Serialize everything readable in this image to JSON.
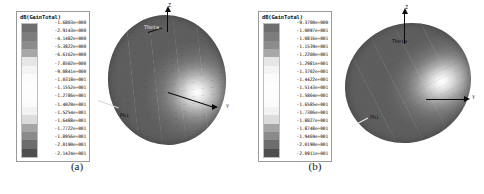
{
  "figure": {
    "panels": [
      {
        "id": "a",
        "caption": "(a)",
        "legend": {
          "title": "dB(GainTotal)",
          "values": [
            "-1.6803e+000",
            "-2.9143e+000",
            "-4.1482e+000",
            "-5.3822e+000",
            "-6.6162e+000",
            "-7.8502e+000",
            "-9.0841e+000",
            "-1.0318e+001",
            "-1.1552e+001",
            "-1.2786e+001",
            "-1.4020e+001",
            "-1.5254e+001",
            "-1.6488e+001",
            "-1.7722e+001",
            "-1.8956e+001",
            "-2.0190e+001",
            "-2.1424e+001"
          ],
          "swatch_colors": [
            "#6e6e6e",
            "#7d7d7d",
            "#8c8c8c",
            "#a8a8a8",
            "#e6e6e6",
            "#f4f4f4",
            "#fbfbfb",
            "#fdfdfd",
            "#fdfdfd",
            "#fbfbfb",
            "#f2f2f2",
            "#dcdcdc",
            "#a5a5a5",
            "#8a8a8a",
            "#6d6d6d",
            "#4e4e4e"
          ]
        },
        "axes": [
          {
            "name": "z-axis",
            "label": "Z"
          },
          {
            "name": "y-axis",
            "label": "Y"
          },
          {
            "name": "theta-axis",
            "label": "Theta"
          },
          {
            "name": "phi-axis",
            "label": "Phi"
          }
        ]
      },
      {
        "id": "b",
        "caption": "(b)",
        "legend": {
          "title": "dB(GainTotal)",
          "values": [
            "-9.3700e+000",
            "-1.0097e+001",
            "-1.0816e+001",
            "-1.1539e+001",
            "-1.2260e+001",
            "-1.2981e+001",
            "-1.3702e+001",
            "-1.4422e+001",
            "-1.5143e+001",
            "-1.5864e+001",
            "-1.6585e+001",
            "-1.7306e+001",
            "-1.8027e+001",
            "-1.8748e+001",
            "-1.9469e+001",
            "-2.0190e+001",
            "-2.0911e+001"
          ],
          "swatch_colors": [
            "#6e6e6e",
            "#7d7d7d",
            "#8c8c8c",
            "#a8a8a8",
            "#e6e6e6",
            "#f4f4f4",
            "#fbfbfb",
            "#fdfdfd",
            "#fdfdfd",
            "#fbfbfb",
            "#f2f2f2",
            "#dcdcdc",
            "#a5a5a5",
            "#8a8a8a",
            "#6d6d6d",
            "#4e4e4e"
          ]
        },
        "axes": [
          {
            "name": "z-axis",
            "label": "Z"
          },
          {
            "name": "y-axis",
            "label": "Y"
          },
          {
            "name": "theta-axis",
            "label": "Theta"
          },
          {
            "name": "phi-axis",
            "label": "Phi"
          }
        ]
      }
    ]
  },
  "chart_data": [
    {
      "type": "heatmap",
      "title": "dB(GainTotal)",
      "panel": "(a)",
      "plot_style": "3d-far-field-radiation-pattern",
      "colorbar_label": "dB(GainTotal)",
      "colorbar_ticks": [
        -1.6803,
        -2.9143,
        -4.1482,
        -5.3822,
        -6.6162,
        -7.8502,
        -9.0841,
        -10.318,
        -11.552,
        -12.786,
        -14.02,
        -15.254,
        -16.488,
        -17.722,
        -18.956,
        -20.19,
        -21.424
      ],
      "zlim": [
        -21.424,
        -1.6803
      ],
      "units": "dB",
      "colormap": "grayscale",
      "legend_position": "left",
      "grid": true,
      "annotations": [
        "Z",
        "Y",
        "Theta",
        "Phi"
      ]
    },
    {
      "type": "heatmap",
      "title": "dB(GainTotal)",
      "panel": "(b)",
      "plot_style": "3d-far-field-radiation-pattern",
      "colorbar_label": "dB(GainTotal)",
      "colorbar_ticks": [
        -9.37,
        -10.097,
        -10.816,
        -11.539,
        -12.26,
        -12.981,
        -13.702,
        -14.422,
        -15.143,
        -15.864,
        -16.585,
        -17.306,
        -18.027,
        -18.748,
        -19.469,
        -20.19,
        -20.911
      ],
      "zlim": [
        -20.911,
        -9.37
      ],
      "units": "dB",
      "colormap": "grayscale",
      "legend_position": "left",
      "grid": true,
      "annotations": [
        "Z",
        "Y",
        "Theta",
        "Phi"
      ]
    }
  ]
}
